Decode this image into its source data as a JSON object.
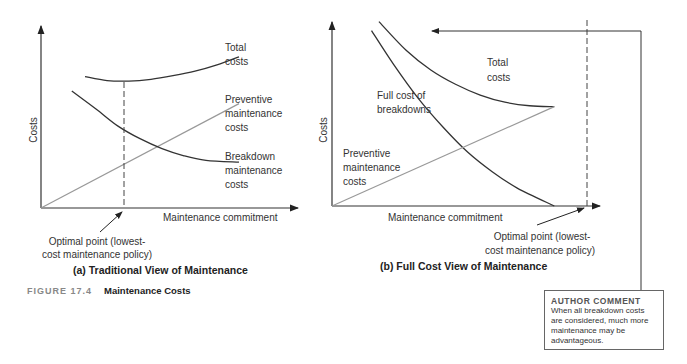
{
  "figure": {
    "number_label": "FIGURE 17.4",
    "title": "Maintenance Costs"
  },
  "chart_data": [
    {
      "type": "line",
      "title": "(a) Traditional View of Maintenance",
      "xlabel": "Maintenance commitment",
      "ylabel": "Costs",
      "grid": false,
      "xlim": [
        0,
        10
      ],
      "ylim": [
        0,
        10
      ],
      "series": [
        {
          "name": "Total costs",
          "label_lines": [
            "Total",
            "costs"
          ],
          "x": [
            2.0,
            3.0,
            4.0,
            5.0,
            6.0,
            7.0,
            8.0,
            9.0
          ],
          "y": [
            7.3,
            7.08,
            7.05,
            7.15,
            7.35,
            7.6,
            7.95,
            8.4
          ]
        },
        {
          "name": "Preventive maintenance costs",
          "label_lines": [
            "Preventive",
            "maintenance",
            "costs"
          ],
          "x": [
            0,
            9.0
          ],
          "y": [
            0,
            5.8
          ]
        },
        {
          "name": "Breakdown maintenance costs",
          "label_lines": [
            "Breakdown",
            "maintenance",
            "costs"
          ],
          "x": [
            1.4,
            2.5,
            3.5,
            4.5,
            5.5,
            6.5,
            7.5,
            9.0
          ],
          "y": [
            6.5,
            5.5,
            4.55,
            3.85,
            3.3,
            2.9,
            2.65,
            2.55
          ]
        }
      ],
      "annotations": [
        {
          "text_lines": [
            "Optimal point (lowest-",
            "cost maintenance policy)"
          ],
          "x": 3.4
        }
      ]
    },
    {
      "type": "line",
      "title": "(b) Full Cost View of Maintenance",
      "xlabel": "Maintenance commitment",
      "ylabel": "Costs",
      "grid": false,
      "xlim": [
        0,
        10
      ],
      "ylim": [
        0,
        10
      ],
      "series": [
        {
          "name": "Total costs",
          "label_lines": [
            "Total",
            "costs"
          ],
          "x": [
            1.9,
            3.0,
            4.0,
            5.0,
            6.0,
            7.0,
            8.0,
            9.0
          ],
          "y": [
            10.3,
            8.7,
            7.6,
            6.8,
            6.2,
            5.8,
            5.6,
            5.55
          ]
        },
        {
          "name": "Full cost of breakdowns",
          "label_lines": [
            "Full cost of",
            "breakdowns"
          ],
          "x": [
            1.6,
            2.5,
            3.5,
            4.5,
            5.5,
            6.5,
            7.5,
            9.0
          ],
          "y": [
            9.8,
            7.9,
            6.0,
            4.4,
            3.0,
            1.9,
            1.0,
            0
          ]
        },
        {
          "name": "Preventive maintenance costs",
          "label_lines": [
            "Preventive",
            "maintenance",
            "costs"
          ],
          "x": [
            0,
            9.0
          ],
          "y": [
            0,
            5.55
          ]
        }
      ],
      "annotations": [
        {
          "text_lines": [
            "Optimal point (lowest-",
            "cost maintenance policy)"
          ],
          "x": 9.0
        }
      ]
    }
  ],
  "author_comment": {
    "title": "AUTHOR COMMENT",
    "text": "When all breakdown costs are considered, much more maintenance may be advantageous."
  }
}
